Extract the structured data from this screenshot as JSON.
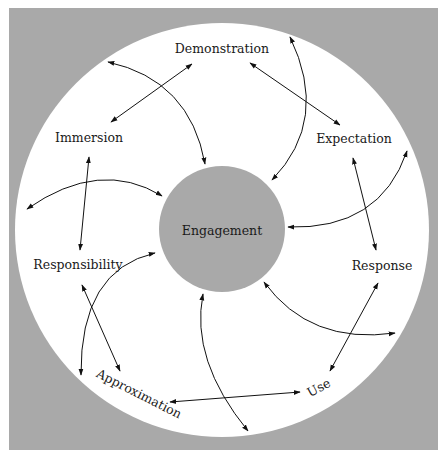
{
  "diagram": {
    "colors": {
      "frame": "#a9a9a9",
      "ring": "#ffffff",
      "center": "#a9a9a9",
      "arrow": "#111111"
    },
    "center_label": "Engagement",
    "nodes": [
      {
        "id": "demonstration",
        "label": "Demonstration"
      },
      {
        "id": "expectation",
        "label": "Expectation"
      },
      {
        "id": "response",
        "label": "Response"
      },
      {
        "id": "use",
        "label": "Use"
      },
      {
        "id": "approximation",
        "label": "Approximation"
      },
      {
        "id": "responsibility",
        "label": "Responsibility"
      },
      {
        "id": "immersion",
        "label": "Immersion"
      }
    ]
  }
}
